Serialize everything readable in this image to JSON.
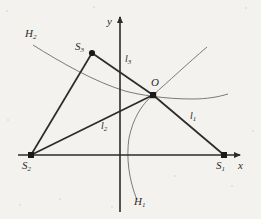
{
  "figure": {
    "background_color": "#f4f2ee",
    "ink_color": "#2b2b2b",
    "curve_color": "#6b6b6b",
    "width": 261,
    "height": 219
  },
  "axes": {
    "x_label": "x",
    "y_label": "y",
    "x_axis_y": 155,
    "y_axis_x": 120,
    "x_range_px": [
      18,
      243
    ],
    "y_range_px": [
      14,
      214
    ]
  },
  "points": [
    {
      "id": "S2",
      "base": "S",
      "sub": "2",
      "x": 31,
      "y": 155,
      "label_x": 22,
      "label_y": 160
    },
    {
      "id": "S1",
      "base": "S",
      "sub": "1",
      "x": 224,
      "y": 155,
      "label_x": 216,
      "label_y": 160
    },
    {
      "id": "S3",
      "base": "S",
      "sub": "3",
      "x": 92,
      "y": 53,
      "label_x": 75,
      "label_y": 40
    },
    {
      "id": "O",
      "base": "O",
      "sub": "",
      "x": 153,
      "y": 95,
      "label_x": 150,
      "label_y": 77
    }
  ],
  "segments": [
    {
      "id": "l1",
      "base": "l",
      "sub": "1",
      "from": "O",
      "to": "S1",
      "label_x": 190,
      "label_y": 112
    },
    {
      "id": "l2",
      "base": "l",
      "sub": "2",
      "from": "O",
      "to": "S2",
      "label_x": 101,
      "label_y": 122
    },
    {
      "id": "l3",
      "base": "l",
      "sub": "3",
      "from": "O",
      "to": "S3",
      "label_x": 125,
      "label_y": 55
    },
    {
      "id": "s2s3",
      "base": "",
      "sub": "",
      "from": "S2",
      "to": "S3",
      "label_x": 0,
      "label_y": 0
    },
    {
      "id": "s2s1",
      "base": "",
      "sub": "",
      "from": "S2",
      "to": "S1",
      "label_x": 0,
      "label_y": 0
    }
  ],
  "curves": [
    {
      "id": "H2",
      "base": "H",
      "sub": "2",
      "label_x": 26,
      "label_y": 28,
      "path": "M 33,45 C 60,62 95,82 125,91 C 140,95 165,99 192,99 C 207,99 218,97 228,94",
      "description": "arc-opening-upward-left-branch"
    },
    {
      "id": "H1",
      "base": "H",
      "sub": "1",
      "label_x": 135,
      "label_y": 196,
      "path": "M 137,200 C 129,180 126,158 129,138 C 133,119 141,105 153,95 C 168,82 187,64 207,47",
      "description": "arc-opening-rightward-through-O"
    }
  ],
  "speckles": [
    {
      "x": 7,
      "y": 11,
      "r": 1.2
    },
    {
      "x": 246,
      "y": 8,
      "r": 1.0
    },
    {
      "x": 20,
      "y": 205,
      "r": 1.4
    },
    {
      "x": 175,
      "y": 176,
      "r": 1.1
    },
    {
      "x": 60,
      "y": 199,
      "r": 0.9
    },
    {
      "x": 232,
      "y": 186,
      "r": 1.2
    },
    {
      "x": 112,
      "y": 207,
      "r": 1.0
    },
    {
      "x": 8,
      "y": 120,
      "r": 0.9
    },
    {
      "x": 253,
      "y": 131,
      "r": 1.1
    },
    {
      "x": 94,
      "y": 7,
      "r": 0.9
    }
  ]
}
